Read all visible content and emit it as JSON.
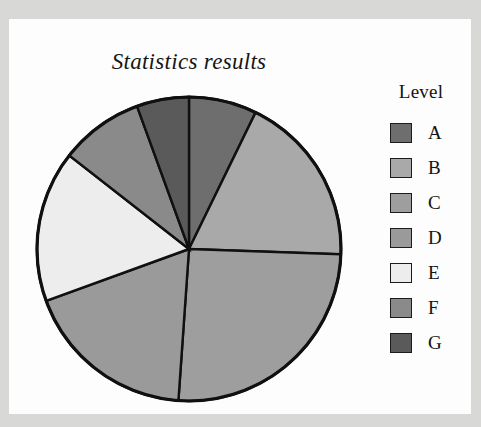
{
  "chart_title": "Statistics results",
  "legend": {
    "title": "Level",
    "entries": [
      {
        "label": "A",
        "color": "#6e6e6e"
      },
      {
        "label": "B",
        "color": "#a9a9a9"
      },
      {
        "label": "C",
        "color": "#9e9e9e"
      },
      {
        "label": "D",
        "color": "#9a9a9a"
      },
      {
        "label": "E",
        "color": "#ededed"
      },
      {
        "label": "F",
        "color": "#8a8a8a"
      },
      {
        "label": "G",
        "color": "#5a5a5a"
      }
    ]
  },
  "chart_data": {
    "type": "pie",
    "title": "Statistics results",
    "legend_title": "Level",
    "legend_position": "right",
    "categories": [
      "A",
      "B",
      "C",
      "D",
      "E",
      "F",
      "G"
    ],
    "values": [
      7.2,
      18.3,
      25.6,
      18.3,
      16.1,
      8.9,
      5.6
    ],
    "units": "percent",
    "start_angle_deg": 0,
    "direction": "clockwise",
    "slice_angles_deg": [
      26,
      66,
      92,
      66,
      58,
      32,
      20
    ],
    "slice_boundaries_deg": [
      0,
      26,
      92,
      184,
      250,
      308,
      340,
      360
    ],
    "colors": [
      "#6e6e6e",
      "#a9a9a9",
      "#9e9e9e",
      "#9a9a9a",
      "#ededed",
      "#8a8a8a",
      "#5a5a5a"
    ],
    "xlabel": "",
    "ylabel": "",
    "grid": false,
    "data_labels_shown": false
  },
  "geometry": {
    "center_x": 180,
    "center_y": 230,
    "radius": 152
  }
}
